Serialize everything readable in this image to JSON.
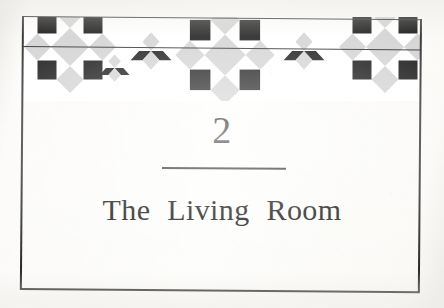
{
  "page": {
    "type": "book-chapter-opening-page",
    "background_color": "#fbfaf8",
    "frame_color": "#2b2b2b"
  },
  "chapter": {
    "number": "2",
    "title": "The Living Room"
  },
  "ornament": {
    "name": "quilt-star-border",
    "description": "eight-pointed LeMoyne star quilt block border",
    "colors": {
      "light": "#d2d2d2",
      "dark": "#111111",
      "background": "#ffffff"
    },
    "stars": [
      {
        "name": "star-left-partial",
        "center_x": 70,
        "clipped": "left"
      },
      {
        "name": "star-center-full",
        "center_x": 225,
        "clipped": "none"
      },
      {
        "name": "star-right-partial",
        "center_x": 385,
        "clipped": "right"
      }
    ]
  },
  "rules": {
    "band_rule": "horizontal-line-through-border",
    "title_rule": "short-horizontal-rule-under-number"
  }
}
